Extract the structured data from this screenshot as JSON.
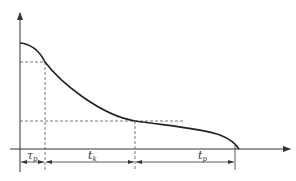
{
  "diagram": {
    "type": "time-decay curve with interval annotations",
    "colors": {
      "line": "#333333",
      "dash": "#555555",
      "background": "#ffffff"
    },
    "axes": {
      "x_axis": {
        "has_arrow": true
      },
      "y_axis": {
        "has_arrow": true
      }
    },
    "intervals": [
      {
        "symbol": "τ",
        "subscript": "p"
      },
      {
        "symbol": "t",
        "subscript": "k"
      },
      {
        "symbol": "t",
        "subscript": "p"
      }
    ]
  }
}
